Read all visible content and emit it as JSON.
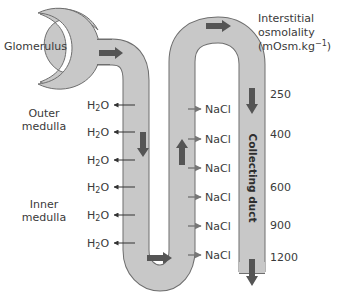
{
  "diagram": {
    "labels": {
      "glomerulus": "Glomerulus",
      "outer_medulla": [
        "Outer",
        "medulla"
      ],
      "inner_medulla": [
        "Inner",
        "medulla"
      ],
      "collecting_duct": "Collecting duct"
    },
    "osmolality_title": {
      "line1": "Interstitial",
      "line2": "osmolality",
      "line3_prefix": "(mOsm.kg",
      "line3_sup": "−1",
      "line3_suffix": ")"
    },
    "osmolality_values": [
      "250",
      "400",
      "600",
      "900",
      "1200"
    ],
    "water_outflows": [
      {
        "base": "H",
        "sub": "2",
        "rest": "O"
      },
      {
        "base": "H",
        "sub": "2",
        "rest": "O"
      },
      {
        "base": "H",
        "sub": "2",
        "rest": "O"
      },
      {
        "base": "H",
        "sub": "2",
        "rest": "O"
      },
      {
        "base": "H",
        "sub": "2",
        "rest": "O"
      },
      {
        "base": "H",
        "sub": "2",
        "rest": "O"
      }
    ],
    "salt_outflows": [
      "NaCl",
      "NaCl",
      "NaCl",
      "NaCl",
      "NaCl",
      "NaCl"
    ],
    "colors": {
      "tube_fill": "#c8c8c8",
      "tube_stroke": "#6e6e6e",
      "flow_arrow": "#555555",
      "text": "#3a3a3a",
      "duct_fill": "#c4c4c4"
    }
  }
}
